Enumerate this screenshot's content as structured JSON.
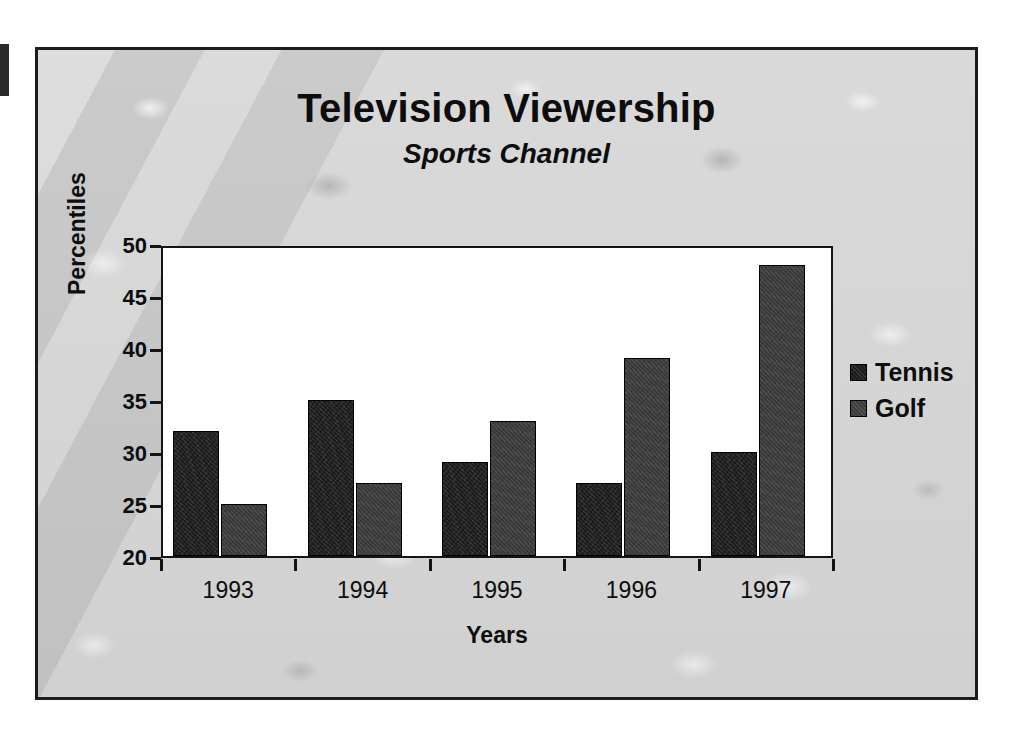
{
  "chart_data": {
    "type": "bar",
    "title": "Television Viewership",
    "subtitle": "Sports Channel",
    "xlabel": "Years",
    "ylabel": "Percentiles",
    "categories": [
      "1993",
      "1994",
      "1995",
      "1996",
      "1997"
    ],
    "series": [
      {
        "name": "Tennis",
        "color": "#1b1b1b",
        "values": [
          32,
          35,
          29,
          27,
          30
        ]
      },
      {
        "name": "Golf",
        "color": "#3c3c3c",
        "values": [
          25,
          27,
          33,
          39,
          48
        ]
      }
    ],
    "ylim": [
      20,
      50
    ],
    "ytick_labels": [
      "50",
      "45",
      "40",
      "35",
      "30",
      "25",
      "20"
    ],
    "ytick_values": [
      50,
      45,
      40,
      35,
      30,
      25,
      20
    ],
    "grid": false,
    "legend_position": "right"
  },
  "legend": {
    "entries": [
      {
        "label": "Tennis"
      },
      {
        "label": "Golf"
      }
    ]
  },
  "colors": {
    "frame_border": "#1c1c1c",
    "plot_background": "#ffffff",
    "axis": "#141414",
    "text": "#0d0d0d"
  }
}
